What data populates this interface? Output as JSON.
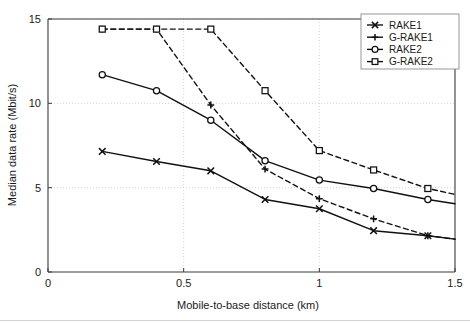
{
  "chart_data": {
    "type": "line",
    "title": "",
    "xlabel": "Mobile-to-base distance (km)",
    "ylabel": "Median data rate (Mbit/s)",
    "xlim": [
      0,
      1.5
    ],
    "ylim": [
      0,
      15
    ],
    "xticks": [
      0,
      0.5,
      1,
      1.5
    ],
    "xtick_labels": [
      "0",
      "0.5",
      "1",
      "1.5"
    ],
    "yticks": [
      0,
      5,
      10,
      15
    ],
    "ytick_labels": [
      "0",
      "5",
      "10",
      "15"
    ],
    "grid": true,
    "legend_position": "top-right",
    "x": [
      0.2,
      0.4,
      0.6,
      0.8,
      1.0,
      1.2,
      1.4,
      1.5
    ],
    "series": [
      {
        "name": "RAKE1",
        "marker": "x",
        "line_style": "solid",
        "color": "#111111",
        "values": [
          7.15,
          6.55,
          6.0,
          4.3,
          3.75,
          2.45,
          2.15,
          1.95
        ]
      },
      {
        "name": "G-RAKE1",
        "marker": "plus",
        "line_style": "dashed",
        "color": "#111111",
        "values": [
          14.4,
          14.4,
          9.9,
          6.1,
          4.35,
          3.15,
          2.15,
          1.95
        ]
      },
      {
        "name": "RAKE2",
        "marker": "circle",
        "line_style": "solid",
        "color": "#111111",
        "values": [
          11.7,
          10.75,
          9.0,
          6.6,
          5.45,
          4.95,
          4.3,
          4.05
        ]
      },
      {
        "name": "G-RAKE2",
        "marker": "square",
        "line_style": "dashed",
        "color": "#111111",
        "values": [
          14.4,
          14.4,
          14.4,
          10.75,
          7.2,
          6.05,
          4.95,
          4.6
        ]
      }
    ]
  },
  "legend": {
    "entries": [
      {
        "label": "RAKE1"
      },
      {
        "label": "G-RAKE1"
      },
      {
        "label": "RAKE2"
      },
      {
        "label": "G-RAKE2"
      }
    ]
  },
  "axes": {
    "x_title": "Mobile-to-base distance (km)",
    "y_title": "Median data rate (Mbit/s)"
  }
}
